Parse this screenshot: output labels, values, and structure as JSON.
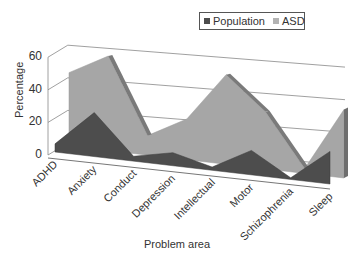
{
  "chart_data": {
    "type": "area",
    "subtype": "3d-area",
    "title": "",
    "xlabel": "Problem area",
    "ylabel": "Percentage",
    "ylim": [
      0,
      60
    ],
    "yticks": [
      "0",
      "20",
      "40",
      "60"
    ],
    "grid": true,
    "legend_position": "top-right",
    "categories": [
      "ADHD",
      "Anxiety",
      "Conduct",
      "Depression",
      "Intellectual",
      "Motor",
      "Schizophrenia",
      "Sleep"
    ],
    "series": [
      {
        "name": "Population",
        "values": [
          5,
          27,
          3,
          8,
          2,
          15,
          1,
          20
        ],
        "color": "#4d4d4d"
      },
      {
        "name": "ASD",
        "values": [
          45,
          58,
          12,
          25,
          55,
          35,
          3,
          42
        ],
        "color": "#a6a6a6"
      }
    ]
  },
  "legend": {
    "items": [
      {
        "label": "Population",
        "color": "#4d4d4d"
      },
      {
        "label": "ASD",
        "color": "#a6a6a6"
      }
    ]
  }
}
